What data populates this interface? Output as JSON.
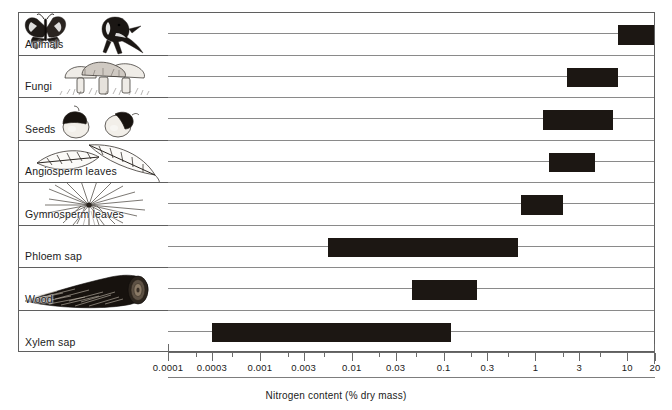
{
  "chart_data": {
    "type": "bar",
    "orientation": "horizontal",
    "subtype": "range-bar",
    "title": "",
    "xlabel": "Nitrogen content (% dry mass)",
    "ylabel": "",
    "xscale": "log",
    "xlim": [
      0.0001,
      20
    ],
    "grid": true,
    "legend": "none",
    "xticks": [
      0.0001,
      0.0003,
      0.001,
      0.003,
      0.01,
      0.03,
      0.1,
      0.3,
      1,
      3,
      10,
      20
    ],
    "xticklabels": [
      "0.0001",
      "0.0003",
      "0.001",
      "0.003",
      "0.01",
      "0.03",
      "0.1",
      "0.3",
      "1",
      "3",
      "10",
      "20"
    ],
    "categories": [
      "Animals",
      "Fungi",
      "Seeds",
      "Angiosperm leaves",
      "Gymnosperm leaves",
      "Phloem sap",
      "Wood",
      "Xylem sap"
    ],
    "ranges": [
      {
        "category": "Animals",
        "low": 8.0,
        "high": 20.0,
        "icon": "butterfly-and-bird-illustration"
      },
      {
        "category": "Fungi",
        "low": 2.2,
        "high": 8.0,
        "icon": "mushrooms-illustration"
      },
      {
        "category": "Seeds",
        "low": 1.2,
        "high": 7.0,
        "icon": "acorn-seeds-illustration"
      },
      {
        "category": "Angiosperm leaves",
        "low": 1.4,
        "high": 4.4,
        "icon": "broadleaf-leaves-illustration"
      },
      {
        "category": "Gymnosperm leaves",
        "low": 0.7,
        "high": 2.0,
        "icon": "conifer-needles-illustration"
      },
      {
        "category": "Phloem sap",
        "low": 0.0055,
        "high": 0.65,
        "icon": "none"
      },
      {
        "category": "Wood",
        "low": 0.045,
        "high": 0.23,
        "icon": "wood-log-illustration"
      },
      {
        "category": "Xylem sap",
        "low": 0.0003,
        "high": 0.12,
        "icon": "none"
      }
    ],
    "units": "% dry mass"
  },
  "figure": {
    "caption": "Nitrogen content (% dry mass)",
    "axis_color": "#6a6a6a",
    "bar_color": "#1c1713",
    "grid_color": "#8a8a8a",
    "background": "#ffffff"
  }
}
